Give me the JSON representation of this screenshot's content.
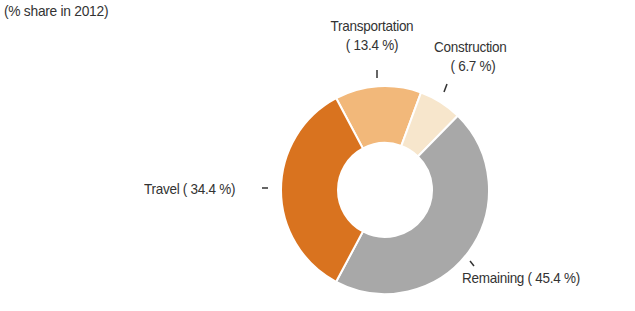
{
  "subtitle": "(% share in 2012)",
  "chart_data": {
    "type": "pie",
    "variant": "donut",
    "subtitle": "(% share in 2012)",
    "categories": [
      "Transportation",
      "Construction",
      "Remaining",
      "Travel"
    ],
    "values": [
      13.4,
      6.7,
      45.4,
      34.4
    ],
    "colors": [
      "#f2b87a",
      "#f7e6cc",
      "#a8a8a8",
      "#d9731f"
    ],
    "labels": [
      "( 13.4 %)",
      "( 6.7 %)",
      "Remaining ( 45.4 %)",
      "Travel ( 34.4 %)"
    ],
    "unit": "%",
    "legend": "none (direct labels)"
  },
  "labels": {
    "transportation_name": "Transportation",
    "transportation_value": "( 13.4 %)",
    "construction_name": "Construction",
    "construction_value": "( 6.7 %)",
    "remaining": "Remaining ( 45.4 %)",
    "travel": "Travel ( 34.4 %)"
  }
}
